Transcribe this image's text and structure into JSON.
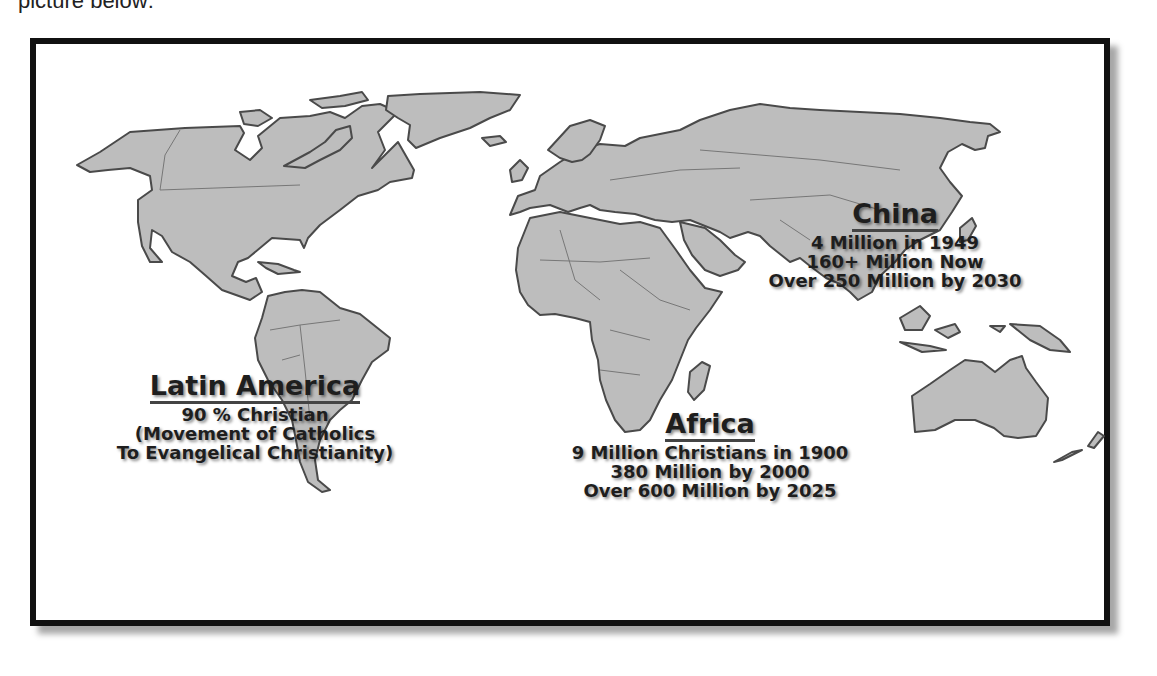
{
  "caption": {
    "partial_text": "picture below:"
  },
  "map": {
    "land_color": "#bdbdbd",
    "outline_color": "#4a4a4a",
    "frame_color": "#111111",
    "regions": [
      {
        "id": "latin-america",
        "title": "Latin America",
        "lines": [
          "90 % Christian",
          "(Movement of Catholics",
          "To Evangelical Christianity)"
        ]
      },
      {
        "id": "africa",
        "title": "Africa",
        "lines": [
          "9 Million Christians in 1900",
          "380 Million by 2000",
          "Over 600 Million by 2025"
        ]
      },
      {
        "id": "china",
        "title": "China",
        "lines": [
          "4 Million in 1949",
          "160+ Million Now",
          "Over 250 Million by 2030"
        ]
      }
    ]
  }
}
